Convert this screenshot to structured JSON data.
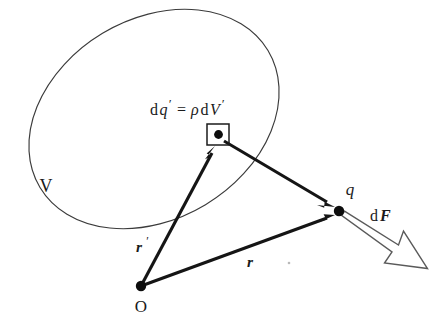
{
  "figure": {
    "kind": "physics-vector-diagram",
    "background_color": "#ffffff",
    "ink_color": "#151515",
    "outline_color": "#3b3b3b",
    "labels": {
      "volume_region": "V",
      "origin": "O",
      "charge_point": "q",
      "source_element_equation_d": "d",
      "source_element_equation_q": "q",
      "source_element_equation_prime1": "′",
      "source_element_equation_equals": "=",
      "source_element_equation_rho": "ρ",
      "source_element_equation_d2": "d",
      "source_element_equation_V": "V",
      "source_element_equation_prime2": "′",
      "source_element_equation_full": "dq′ = ρdV′",
      "position_vector_source": "r",
      "position_vector_source_prime": "′",
      "position_vector_field": "r",
      "force_label_d": "d",
      "force_label_F": "F",
      "force_label_full": "dF"
    },
    "geometry": {
      "blob": {
        "center_x": 154,
        "center_y": 119,
        "radius_x": 133,
        "radius_y": 100,
        "rotation_deg": -31
      },
      "origin_point": {
        "x": 141,
        "y": 286,
        "dot_radius": 5.2
      },
      "charge_point": {
        "x": 339,
        "y": 211,
        "dot_radius": 5.2
      },
      "element_point": {
        "x": 218,
        "y": 135,
        "dot_radius": 4.4
      },
      "element_box": {
        "x": 207,
        "y": 124,
        "width": 22,
        "height": 21
      },
      "vector_r_prime": {
        "x1": 141,
        "y1": 286,
        "x2": 215,
        "y2": 147
      },
      "vector_r": {
        "x1": 141,
        "y1": 286,
        "x2": 335,
        "y2": 215
      },
      "vector_separation": {
        "x1": 224,
        "y1": 141,
        "x2": 334,
        "y2": 206
      },
      "vector_force": {
        "x1": 345,
        "y1": 215,
        "x2": 427,
        "y2": 268
      }
    },
    "label_positions": {
      "volume_region": {
        "x": 46,
        "y": 188
      },
      "origin": {
        "x": 141,
        "y": 308
      },
      "charge_point": {
        "x": 350,
        "y": 191
      },
      "source_element_equation": {
        "x": 150,
        "y": 111
      },
      "position_vector_source": {
        "x": 136,
        "y": 248
      },
      "position_vector_field": {
        "x": 250,
        "y": 263
      },
      "force_label": {
        "x": 378,
        "y": 217
      }
    }
  }
}
